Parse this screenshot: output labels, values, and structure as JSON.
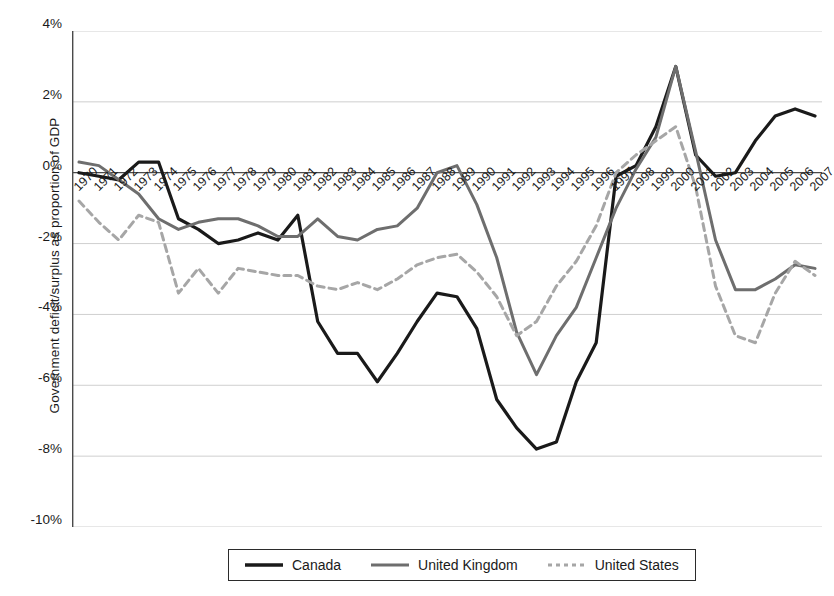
{
  "chart_data": {
    "type": "line",
    "title": "",
    "xlabel": "",
    "ylabel": "Government deficit/surplus as proportion of GDP",
    "ylim": [
      -10,
      4
    ],
    "ytick_labels": [
      "4%",
      "2%",
      "0%",
      "-2%",
      "-4%",
      "-6%",
      "-8%",
      "-10%"
    ],
    "ytick_values": [
      4,
      2,
      0,
      -2,
      -4,
      -6,
      -8,
      -10
    ],
    "grid": true,
    "legend_position": "bottom",
    "x": [
      1970,
      1971,
      1972,
      1973,
      1974,
      1975,
      1976,
      1977,
      1978,
      1979,
      1980,
      1981,
      1982,
      1983,
      1984,
      1985,
      1986,
      1987,
      1988,
      1989,
      1990,
      1991,
      1992,
      1993,
      1994,
      1995,
      1996,
      1997,
      1998,
      1999,
      2000,
      2001,
      2002,
      2003,
      2004,
      2005,
      2006,
      2007
    ],
    "categories": [
      "1970",
      "1971",
      "1972",
      "1973",
      "1974",
      "1975",
      "1976",
      "1977",
      "1978",
      "1979",
      "1980",
      "1981",
      "1982",
      "1983",
      "1984",
      "1985",
      "1986",
      "1987",
      "1988",
      "1989",
      "1990",
      "1991",
      "1992",
      "1993",
      "1994",
      "1995",
      "1996",
      "1997",
      "1998",
      "1999",
      "2000",
      "2001",
      "2002",
      "2003",
      "2004",
      "2005",
      "2006",
      "2007"
    ],
    "series": [
      {
        "name": "Canada",
        "color": "#1a1a1a",
        "style": "solid",
        "width": 3.2,
        "values": [
          0.0,
          -0.1,
          -0.2,
          0.3,
          0.3,
          -1.3,
          -1.6,
          -2.0,
          -1.9,
          -1.7,
          -1.9,
          -1.2,
          -4.2,
          -5.1,
          -5.1,
          -5.9,
          -5.1,
          -4.2,
          -3.4,
          -3.5,
          -4.4,
          -6.4,
          -7.2,
          -7.8,
          -7.6,
          -5.9,
          -4.8,
          -0.1,
          0.2,
          1.3,
          3.0,
          0.5,
          -0.1,
          0.0,
          0.9,
          1.6,
          1.8,
          1.6
        ]
      },
      {
        "name": "United Kingdom",
        "color": "#6e6e6e",
        "style": "solid",
        "width": 3.0,
        "values": [
          0.3,
          0.2,
          -0.2,
          -0.6,
          -1.3,
          -1.6,
          -1.4,
          -1.3,
          -1.3,
          -1.5,
          -1.8,
          -1.8,
          -1.3,
          -1.8,
          -1.9,
          -1.6,
          -1.5,
          -1.0,
          0.0,
          0.2,
          -0.9,
          -2.4,
          -4.5,
          -5.7,
          -4.6,
          -3.8,
          -2.4,
          -1.0,
          0.1,
          1.0,
          3.0,
          0.6,
          -1.9,
          -3.3,
          -3.3,
          -3.0,
          -2.6,
          -2.7
        ]
      },
      {
        "name": "United States",
        "color": "#a6a6a6",
        "style": "dashed",
        "width": 3.0,
        "values": [
          -0.8,
          -1.4,
          -1.9,
          -1.2,
          -1.4,
          -3.4,
          -2.7,
          -3.4,
          -2.7,
          -2.8,
          -2.9,
          -2.9,
          -3.2,
          -3.3,
          -3.1,
          -3.3,
          -3.0,
          -2.6,
          -2.4,
          -2.3,
          -2.8,
          -3.5,
          -4.6,
          -4.2,
          -3.2,
          -2.5,
          -1.5,
          0.0,
          0.5,
          0.9,
          1.3,
          -0.4,
          -3.2,
          -4.6,
          -4.8,
          -3.4,
          -2.5,
          -2.9
        ]
      }
    ]
  },
  "legend": {
    "items": [
      {
        "label": "Canada"
      },
      {
        "label": "United Kingdom"
      },
      {
        "label": "United States"
      }
    ]
  }
}
